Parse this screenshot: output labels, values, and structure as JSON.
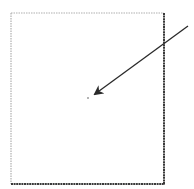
{
  "diagram": {
    "box": {
      "x": 11,
      "y": 13,
      "width": 153,
      "height": 171
    },
    "colors": {
      "box_light": "#b0b0b0",
      "box_dark": "#3a3a3a",
      "arrow": "#2a2a2a",
      "dot": "#555555",
      "background": "#ffffff"
    },
    "arrow": {
      "x1": 188,
      "y1": 26,
      "x2": 95,
      "y2": 94
    },
    "dot": {
      "cx": 88,
      "cy": 98
    }
  }
}
